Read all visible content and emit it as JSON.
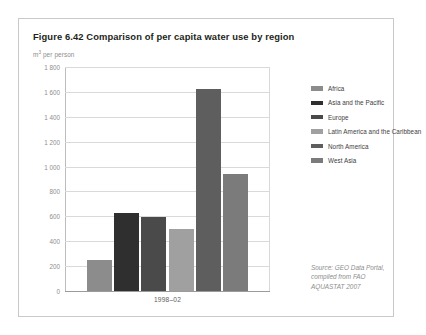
{
  "figure": {
    "title": "Figure 6.42 Comparison of per capita water use by region",
    "unit_label_prefix": "m",
    "unit_label_sup": "3",
    "unit_label_suffix": " per person",
    "x_axis_label": "1998–02"
  },
  "source": {
    "line1": "Source: GEO Data Portal,",
    "line2": "compiled from FAO",
    "line3": "AQUASTAT 2007"
  },
  "legend": {
    "items": [
      {
        "label": "Africa",
        "color": "#8c8c8c"
      },
      {
        "label": "Asia and the Pacific",
        "color": "#2f2f2f"
      },
      {
        "label": "Europe",
        "color": "#4a4a4a"
      },
      {
        "label": "Latin America and the Caribbean",
        "color": "#a0a0a0"
      },
      {
        "label": "North America",
        "color": "#5e5e5e"
      },
      {
        "label": "West Asia",
        "color": "#7b7b7b"
      }
    ]
  },
  "y_axis": {
    "ticks": [
      "1 800",
      "1 600",
      "1 400",
      "1 200",
      "1 000",
      "800",
      "600",
      "400",
      "200",
      "0"
    ]
  },
  "chart_data": {
    "type": "bar",
    "title": "Figure 6.42 Comparison of per capita water use by region",
    "xlabel": "1998–02",
    "ylabel": "m3 per person",
    "ylim": [
      0,
      1800
    ],
    "ytick_values": [
      0,
      200,
      400,
      600,
      800,
      1000,
      1200,
      1400,
      1600,
      1800
    ],
    "grid": true,
    "legend_position": "right",
    "categories": [
      "Africa",
      "Asia and the Pacific",
      "Europe",
      "Latin America and the Caribbean",
      "North America",
      "West Asia"
    ],
    "values": [
      250,
      625,
      595,
      500,
      1620,
      940
    ],
    "colors": [
      "#8c8c8c",
      "#2f2f2f",
      "#4a4a4a",
      "#a0a0a0",
      "#5e5e5e",
      "#7b7b7b"
    ],
    "annotations": [
      "Source: GEO Data Portal, compiled from FAO AQUASTAT 2007"
    ]
  }
}
